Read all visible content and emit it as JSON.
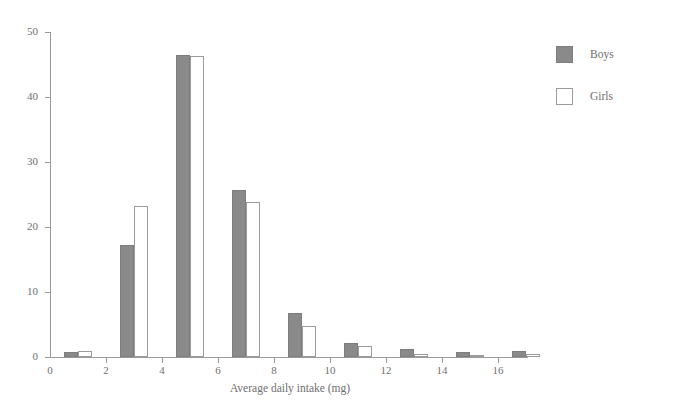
{
  "top_remnant": "",
  "chart_data": {
    "type": "bar",
    "title": "",
    "xlabel": "Average daily intake (mg)",
    "ylabel": "Percentage",
    "xlim": [
      0,
      17
    ],
    "ylim": [
      0,
      50
    ],
    "grid": false,
    "legend_position": "right",
    "x_ticks": [
      0,
      2,
      4,
      6,
      8,
      10,
      12,
      14,
      16
    ],
    "x_tick_labels": [
      "0",
      "2",
      "4",
      "6",
      "8",
      "10",
      "12",
      "14",
      "16"
    ],
    "y_ticks": [
      0,
      10,
      20,
      30,
      40,
      50
    ],
    "y_tick_labels": [
      "0",
      "10",
      "20",
      "30",
      "40",
      "50"
    ],
    "bin_width": 1,
    "bin_starts": [
      0,
      2,
      4,
      6,
      8,
      10,
      12,
      14,
      16
    ],
    "categories": [
      "0-1",
      "2-3",
      "4-5",
      "6-7",
      "8-9",
      "10-11",
      "12-13",
      "14-15",
      "16-17"
    ],
    "series": [
      {
        "name": "Boys",
        "color": "#8a8a8a",
        "filled": true,
        "values": [
          0.7,
          17.3,
          46.5,
          25.7,
          6.8,
          2.1,
          1.2,
          0.7,
          1.0
        ]
      },
      {
        "name": "Girls",
        "color": "#ffffff",
        "filled": false,
        "values": [
          0.9,
          23.2,
          46.3,
          23.8,
          4.8,
          1.7,
          0.4,
          0.2,
          0.4
        ]
      }
    ]
  },
  "legend": {
    "items": [
      {
        "label": "Boys"
      },
      {
        "label": "Girls"
      }
    ]
  }
}
